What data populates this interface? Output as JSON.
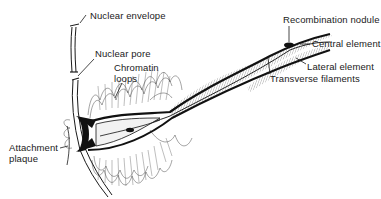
{
  "diagram": {
    "colors": {
      "ink": "#1a1a1a",
      "background": "#ffffff",
      "fill_light": "#e6e6e6"
    },
    "labels": {
      "nuclear_envelope": "Nuclear envelope",
      "nuclear_pore": "Nuclear pore",
      "chromatin_loops_line1": "Chromatin",
      "chromatin_loops_line2": "loops",
      "attachment_plaque_line1": "Attachment",
      "attachment_plaque_line2": "plaque",
      "recombination_nodule": "Recombination nodule",
      "central_element": "Central element",
      "lateral_element": "Lateral element",
      "transverse_filaments": "Transverse filaments"
    }
  }
}
